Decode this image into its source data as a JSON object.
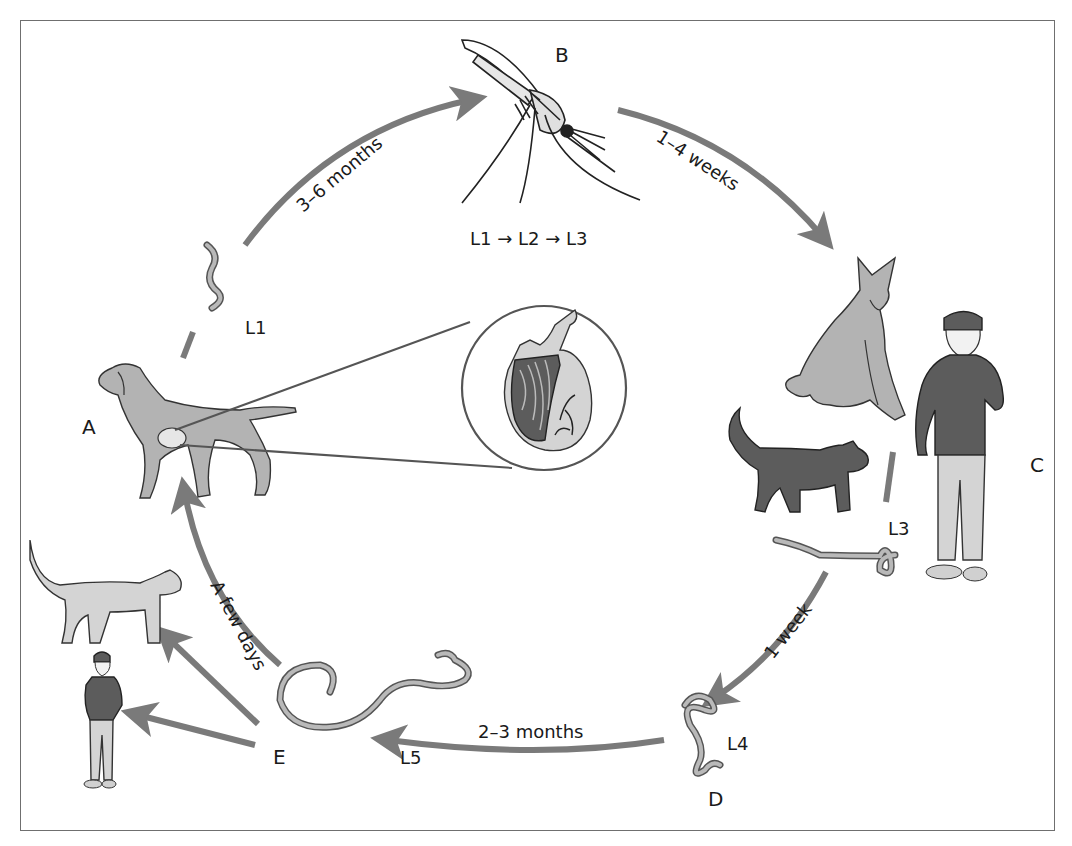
{
  "diagram": {
    "nodes": {
      "A": {
        "label": "A",
        "desc": "Dog (definitive host) with adult worms in heart"
      },
      "B": {
        "label": "B",
        "desc": "Mosquito (intermediate host)"
      },
      "C": {
        "label": "C",
        "desc": "Dog, cat, human receiving L3 larvae"
      },
      "D": {
        "label": "D",
        "desc": "L4 larva"
      },
      "E": {
        "label": "E",
        "desc": "L5 larva"
      }
    },
    "stage_labels": {
      "l1": "L1",
      "mosquito_development": "L1 → L2 → L3",
      "l3": "L3",
      "l4": "L4",
      "l5": "L5"
    },
    "durations": {
      "a_to_b": "3–6 months",
      "b_to_c": "1–4 weeks",
      "c_to_d": "1 week",
      "d_to_e": "2–3 months",
      "e_to_a": "A few days"
    },
    "edges": [
      {
        "from": "A",
        "to": "B",
        "label": "3–6 months"
      },
      {
        "from": "B",
        "to": "C",
        "label": "1–4 weeks"
      },
      {
        "from": "C",
        "to": "D",
        "label": "1 week"
      },
      {
        "from": "D",
        "to": "E",
        "label": "2–3 months"
      },
      {
        "from": "E",
        "to": "A",
        "label": "A few days"
      },
      {
        "from": "E",
        "to": "cat",
        "label": ""
      },
      {
        "from": "E",
        "to": "human",
        "label": ""
      }
    ],
    "colors": {
      "arrow": "#7a7a7a",
      "animal_fill": "#b3b3b3",
      "dark_fill": "#5c5c5c",
      "frame": "#6f6f6f"
    }
  }
}
